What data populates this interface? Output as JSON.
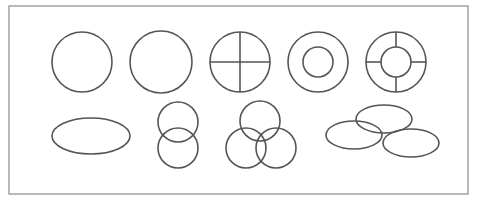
{
  "canvas": {
    "width": 479,
    "height": 200,
    "background": "#ffffff"
  },
  "colors": {
    "frame": "#8a8a8a",
    "stroke": "#555555"
  },
  "frame": {
    "x": 9,
    "y": 6,
    "width": 459,
    "height": 188
  },
  "rows": [
    {
      "name": "top-row",
      "shapes": [
        {
          "type": "circle",
          "label": "plain-circle-1",
          "cx": 82,
          "cy": 62,
          "r": 30
        },
        {
          "type": "circle",
          "label": "plain-circle-2",
          "cx": 161,
          "cy": 62,
          "r": 31
        },
        {
          "type": "quartered-circle",
          "label": "circle-with-cross",
          "cx": 240,
          "cy": 62,
          "r": 30
        },
        {
          "type": "ring",
          "label": "concentric-rings",
          "cx": 318,
          "cy": 62,
          "r": 30,
          "inner_r": 15
        },
        {
          "type": "ring-spokes",
          "label": "ring-with-spokes",
          "cx": 396,
          "cy": 62,
          "r": 30,
          "inner_r": 15
        }
      ]
    },
    {
      "name": "bottom-row",
      "shapes": [
        {
          "type": "ellipse",
          "label": "single-ellipse",
          "cx": 91,
          "cy": 136,
          "rx": 39,
          "ry": 18
        },
        {
          "type": "circle-group",
          "label": "two-stacked-circles",
          "items": [
            {
              "cx": 178,
              "cy": 122,
              "r": 20
            },
            {
              "cx": 178,
              "cy": 148,
              "r": 20
            }
          ]
        },
        {
          "type": "circle-group",
          "label": "three-overlapping-circles",
          "items": [
            {
              "cx": 260,
              "cy": 121,
              "r": 20
            },
            {
              "cx": 246,
              "cy": 148,
              "r": 20
            },
            {
              "cx": 276,
              "cy": 148,
              "r": 20
            }
          ]
        },
        {
          "type": "ellipse-group",
          "label": "three-overlapping-ellipses",
          "items": [
            {
              "cx": 354,
              "cy": 135,
              "rx": 28,
              "ry": 14
            },
            {
              "cx": 384,
              "cy": 119,
              "rx": 28,
              "ry": 14
            },
            {
              "cx": 411,
              "cy": 143,
              "rx": 28,
              "ry": 14
            }
          ]
        }
      ]
    }
  ]
}
